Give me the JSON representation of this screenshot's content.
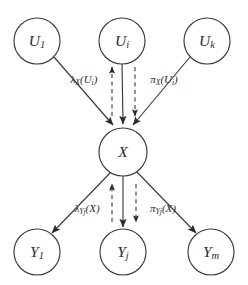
{
  "figure": {
    "background_color": "#ffffff",
    "stroke_color": "#3a3a3a",
    "text_color": "#2b2b2b"
  },
  "nodes": {
    "parents": [
      {
        "id": "U1",
        "symbol": "U",
        "subscript": "1",
        "cx": 37,
        "cy": 41,
        "r": 23
      },
      {
        "id": "Ui",
        "symbol": "U",
        "subscript": "i",
        "cx": 122,
        "cy": 41,
        "r": 23
      },
      {
        "id": "Uk",
        "symbol": "U",
        "subscript": "k",
        "cx": 207,
        "cy": 41,
        "r": 23
      }
    ],
    "center": [
      {
        "id": "X",
        "symbol": "X",
        "subscript": "",
        "cx": 123,
        "cy": 152,
        "r": 24
      }
    ],
    "children": [
      {
        "id": "Y1",
        "symbol": "Y",
        "subscript": "1",
        "cx": 37,
        "cy": 252,
        "r": 23
      },
      {
        "id": "Yj",
        "symbol": "Y",
        "subscript": "j",
        "cx": 123,
        "cy": 252,
        "r": 23
      },
      {
        "id": "Ym",
        "symbol": "Y",
        "subscript": "m",
        "cx": 211,
        "cy": 252,
        "r": 23
      }
    ]
  },
  "edges": {
    "solid": [
      {
        "id": "U1-to-X",
        "from": "U1",
        "to": "X",
        "x1": 54,
        "y1": 57,
        "x2": 113,
        "y2": 125
      },
      {
        "id": "Ui-to-X",
        "from": "Ui",
        "to": "X",
        "x1": 122,
        "y1": 64,
        "x2": 123,
        "y2": 124
      },
      {
        "id": "Uk-to-X",
        "from": "Uk",
        "to": "X",
        "x1": 190,
        "y1": 57,
        "x2": 133,
        "y2": 125
      },
      {
        "id": "X-to-Y1",
        "from": "X",
        "to": "Y1",
        "x1": 112,
        "y1": 171,
        "x2": 52,
        "y2": 233
      },
      {
        "id": "X-to-Yj",
        "from": "X",
        "to": "Yj",
        "x1": 123,
        "y1": 176,
        "x2": 123,
        "y2": 227
      },
      {
        "id": "X-to-Ym",
        "from": "X",
        "to": "Ym",
        "x1": 136,
        "y1": 171,
        "x2": 196,
        "y2": 233
      }
    ],
    "dashed": [
      {
        "id": "lambda-X-up",
        "direction": "up",
        "x1": 112,
        "y1": 116,
        "x2": 112,
        "y2": 67
      },
      {
        "id": "pi-X-down",
        "direction": "down",
        "x1": 135,
        "y1": 67,
        "x2": 135,
        "y2": 116
      },
      {
        "id": "lambda-Y-up",
        "direction": "up",
        "x1": 112,
        "y1": 222,
        "x2": 112,
        "y2": 184
      },
      {
        "id": "pi-Y-down",
        "direction": "down",
        "x1": 136,
        "y1": 184,
        "x2": 136,
        "y2": 222
      }
    ]
  },
  "messages": [
    {
      "id": "lambda-X-Ui",
      "base": "λ",
      "subscript": "X",
      "argument": "(U",
      "arg_subscript": "i",
      "arg_close": ")",
      "x": 84,
      "y": 80
    },
    {
      "id": "pi-X-Ui",
      "base": "π",
      "subscript": "X",
      "argument": "(U",
      "arg_subscript": "i",
      "arg_close": ")",
      "x": 164,
      "y": 80
    },
    {
      "id": "lambda-Yj-X",
      "base": "λ",
      "subscript": "Yj",
      "argument": "(X",
      "arg_subscript": "",
      "arg_close": ")",
      "x": 87,
      "y": 209
    },
    {
      "id": "pi-Yj-X",
      "base": "π",
      "subscript": "Yj",
      "argument": "(X",
      "arg_subscript": "",
      "arg_close": ")",
      "x": 163,
      "y": 209
    }
  ]
}
